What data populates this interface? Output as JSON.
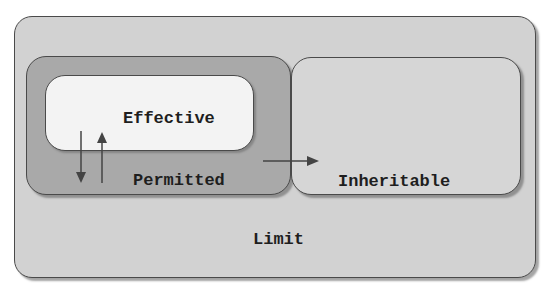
{
  "diagram": {
    "title": "",
    "sets": {
      "limit": {
        "label": "Limit",
        "fill": "#d2d2d2"
      },
      "permitted": {
        "label": "Permitted",
        "fill": "#a9a9a9"
      },
      "effective": {
        "label": "Effective",
        "fill": "#f3f3f3"
      },
      "inheritable": {
        "label": "Inheritable",
        "fill": "#d6d6d6"
      }
    },
    "nesting": [
      {
        "parent": "limit",
        "children": [
          "permitted",
          "inheritable"
        ]
      },
      {
        "parent": "permitted",
        "children": [
          "effective"
        ]
      }
    ],
    "edges": [
      {
        "from": "effective",
        "to": "permitted",
        "direction": "down"
      },
      {
        "from": "permitted",
        "to": "effective",
        "direction": "up"
      },
      {
        "from": "permitted",
        "to": "inheritable",
        "direction": "right"
      }
    ],
    "colors": {
      "border": "#4a4a4a",
      "arrow": "#444444",
      "text": "#1e1e1e"
    }
  }
}
